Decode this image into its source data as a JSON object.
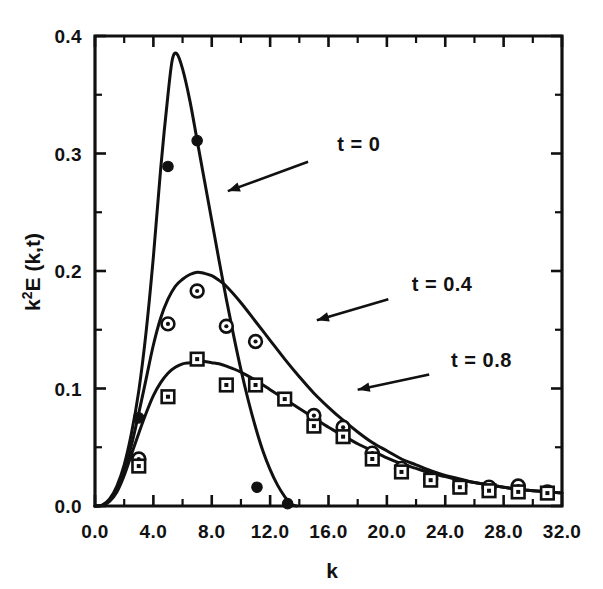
{
  "chart_data": {
    "type": "line",
    "title": "",
    "xlabel": "k",
    "ylabel": "k²E (k,t)",
    "xlim": [
      0.0,
      32.0
    ],
    "ylim": [
      0.0,
      0.4
    ],
    "grid": false,
    "legend_position": "inline-annotations",
    "x_ticks_major": [
      "0.0",
      "4.0",
      "8.0",
      "12.0",
      "16.0",
      "20.0",
      "24.0",
      "28.0",
      "32.0"
    ],
    "x_ticks_major_values": [
      0,
      4,
      8,
      12,
      16,
      20,
      24,
      28,
      32
    ],
    "x_ticks_minor_values": [
      2,
      6,
      10,
      14,
      18,
      22,
      26,
      30
    ],
    "y_ticks_major": [
      "0.0",
      "0.1",
      "0.2",
      "0.3",
      "0.4"
    ],
    "y_ticks_major_values": [
      0.0,
      0.1,
      0.2,
      0.3,
      0.4
    ],
    "y_ticks_minor_values": [
      0.05,
      0.15,
      0.25,
      0.35
    ],
    "annotations": [
      {
        "id": "t0",
        "text": "t = 0",
        "text_x": 16.6,
        "text_y": 0.302,
        "arrow_from_x": 14.6,
        "arrow_from_y": 0.293,
        "arrow_to_x": 9.1,
        "arrow_to_y": 0.268
      },
      {
        "id": "t04",
        "text": "t = 0.4",
        "text_x": 21.7,
        "text_y": 0.183,
        "arrow_from_x": 20.1,
        "arrow_from_y": 0.176,
        "arrow_to_x": 15.2,
        "arrow_to_y": 0.158
      },
      {
        "id": "t08",
        "text": "t = 0.8",
        "text_x": 24.4,
        "text_y": 0.118,
        "arrow_from_x": 22.9,
        "arrow_from_y": 0.112,
        "arrow_to_x": 18.0,
        "arrow_to_y": 0.099
      }
    ],
    "series": [
      {
        "name": "t = 0",
        "marker": "filled-circle",
        "curve": [
          [
            0.0,
            0.0
          ],
          [
            0.5,
            0.0008
          ],
          [
            1.0,
            0.006
          ],
          [
            1.5,
            0.017
          ],
          [
            2.0,
            0.035
          ],
          [
            2.5,
            0.062
          ],
          [
            3.0,
            0.098
          ],
          [
            3.5,
            0.148
          ],
          [
            4.0,
            0.212
          ],
          [
            4.5,
            0.287
          ],
          [
            5.0,
            0.35
          ],
          [
            5.3,
            0.38
          ],
          [
            5.6,
            0.385
          ],
          [
            6.0,
            0.372
          ],
          [
            6.5,
            0.345
          ],
          [
            7.0,
            0.311
          ],
          [
            7.5,
            0.277
          ],
          [
            8.0,
            0.243
          ],
          [
            8.5,
            0.209
          ],
          [
            9.0,
            0.176
          ],
          [
            9.5,
            0.145
          ],
          [
            10.0,
            0.116
          ],
          [
            10.5,
            0.09
          ],
          [
            11.0,
            0.067
          ],
          [
            11.5,
            0.047
          ],
          [
            12.0,
            0.031
          ],
          [
            12.5,
            0.018
          ],
          [
            13.0,
            0.008
          ],
          [
            13.4,
            0.002
          ],
          [
            13.8,
            0.0
          ]
        ],
        "points": [
          [
            5.0,
            0.289
          ],
          [
            7.0,
            0.311
          ],
          [
            3.0,
            0.075
          ],
          [
            11.1,
            0.016
          ],
          [
            13.2,
            0.002
          ]
        ]
      },
      {
        "name": "t = 0.4",
        "marker": "circle-dot",
        "curve": [
          [
            0.0,
            0.0
          ],
          [
            0.5,
            0.0006
          ],
          [
            1.0,
            0.005
          ],
          [
            1.5,
            0.014
          ],
          [
            2.0,
            0.03
          ],
          [
            2.5,
            0.052
          ],
          [
            3.0,
            0.079
          ],
          [
            3.5,
            0.108
          ],
          [
            4.0,
            0.137
          ],
          [
            4.5,
            0.16
          ],
          [
            5.0,
            0.176
          ],
          [
            5.5,
            0.187
          ],
          [
            6.0,
            0.193
          ],
          [
            6.5,
            0.197
          ],
          [
            7.0,
            0.199
          ],
          [
            7.5,
            0.198
          ],
          [
            8.0,
            0.196
          ],
          [
            8.5,
            0.192
          ],
          [
            9.0,
            0.187
          ],
          [
            10.0,
            0.173
          ],
          [
            11.0,
            0.157
          ],
          [
            12.0,
            0.141
          ],
          [
            13.0,
            0.125
          ],
          [
            14.0,
            0.11
          ],
          [
            15.0,
            0.096
          ],
          [
            16.0,
            0.084
          ],
          [
            17.0,
            0.073
          ],
          [
            18.0,
            0.063
          ],
          [
            19.0,
            0.054
          ],
          [
            20.0,
            0.047
          ],
          [
            21.0,
            0.04
          ],
          [
            22.0,
            0.035
          ],
          [
            23.0,
            0.03
          ],
          [
            24.0,
            0.026
          ],
          [
            25.0,
            0.023
          ],
          [
            26.0,
            0.02
          ],
          [
            27.0,
            0.018
          ],
          [
            28.0,
            0.016
          ],
          [
            29.0,
            0.014
          ],
          [
            30.0,
            0.013
          ],
          [
            31.0,
            0.012
          ],
          [
            32.0,
            0.011
          ]
        ],
        "points": [
          [
            3.0,
            0.04
          ],
          [
            5.0,
            0.155
          ],
          [
            7.0,
            0.183
          ],
          [
            9.0,
            0.153
          ],
          [
            11.0,
            0.14
          ],
          [
            15.0,
            0.077
          ],
          [
            17.0,
            0.067
          ],
          [
            19.0,
            0.045
          ],
          [
            21.0,
            0.032
          ],
          [
            23.0,
            0.023
          ],
          [
            25.0,
            0.017
          ],
          [
            27.0,
            0.016
          ],
          [
            29.0,
            0.017
          ],
          [
            31.0,
            0.012
          ]
        ]
      },
      {
        "name": "t = 0.8",
        "marker": "square-dot",
        "curve": [
          [
            0.0,
            0.0
          ],
          [
            0.5,
            0.0005
          ],
          [
            1.0,
            0.004
          ],
          [
            1.5,
            0.012
          ],
          [
            2.0,
            0.026
          ],
          [
            2.5,
            0.044
          ],
          [
            3.0,
            0.062
          ],
          [
            3.5,
            0.079
          ],
          [
            4.0,
            0.094
          ],
          [
            4.5,
            0.105
          ],
          [
            5.0,
            0.113
          ],
          [
            5.5,
            0.118
          ],
          [
            6.0,
            0.121
          ],
          [
            6.5,
            0.122
          ],
          [
            7.0,
            0.123
          ],
          [
            7.5,
            0.123
          ],
          [
            8.0,
            0.122
          ],
          [
            8.5,
            0.121
          ],
          [
            9.0,
            0.119
          ],
          [
            10.0,
            0.114
          ],
          [
            11.0,
            0.107
          ],
          [
            12.0,
            0.099
          ],
          [
            13.0,
            0.091
          ],
          [
            14.0,
            0.083
          ],
          [
            15.0,
            0.075
          ],
          [
            16.0,
            0.067
          ],
          [
            17.0,
            0.06
          ],
          [
            18.0,
            0.053
          ],
          [
            19.0,
            0.047
          ],
          [
            20.0,
            0.041
          ],
          [
            21.0,
            0.036
          ],
          [
            22.0,
            0.032
          ],
          [
            23.0,
            0.028
          ],
          [
            24.0,
            0.025
          ],
          [
            25.0,
            0.022
          ],
          [
            26.0,
            0.02
          ],
          [
            27.0,
            0.018
          ],
          [
            28.0,
            0.016
          ],
          [
            29.0,
            0.014
          ],
          [
            30.0,
            0.013
          ],
          [
            31.0,
            0.012
          ],
          [
            32.0,
            0.011
          ]
        ],
        "points": [
          [
            3.0,
            0.034
          ],
          [
            5.0,
            0.093
          ],
          [
            7.0,
            0.125
          ],
          [
            9.0,
            0.103
          ],
          [
            11.0,
            0.103
          ],
          [
            13.0,
            0.091
          ],
          [
            15.0,
            0.068
          ],
          [
            17.0,
            0.059
          ],
          [
            19.0,
            0.04
          ],
          [
            21.0,
            0.029
          ],
          [
            23.0,
            0.022
          ],
          [
            25.0,
            0.016
          ],
          [
            27.0,
            0.013
          ],
          [
            29.0,
            0.012
          ],
          [
            31.0,
            0.011
          ]
        ]
      }
    ]
  },
  "axes": {
    "x_title": "k",
    "y_title": "k²E (k,t)",
    "y_title_base": "k",
    "y_title_sup": "2",
    "y_title_rest": "E (k,t)"
  },
  "colors": {
    "ink": "#111111",
    "background": "#ffffff"
  }
}
